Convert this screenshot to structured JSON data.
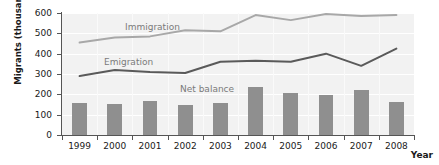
{
  "chart_data": {
    "type": "bar",
    "title": "",
    "xlabel": "Year",
    "ylabel": "Migrants (thousands)",
    "categories": [
      "1999",
      "2000",
      "2001",
      "2002",
      "2003",
      "2004",
      "2005",
      "2006",
      "2007",
      "2008"
    ],
    "ylim": [
      0,
      600
    ],
    "yticks": [
      0,
      100,
      200,
      300,
      400,
      500,
      600
    ],
    "grid": true,
    "legend_position": "inline-annotations",
    "series": [
      {
        "name": "Immigration",
        "type": "line",
        "color": "#a8a8a8",
        "values": [
          455,
          480,
          485,
          515,
          510,
          590,
          565,
          595,
          585,
          590
        ]
      },
      {
        "name": "Emigration",
        "type": "line",
        "color": "#5a5a5a",
        "values": [
          290,
          320,
          310,
          305,
          360,
          365,
          360,
          400,
          340,
          425
        ]
      },
      {
        "name": "Net balance",
        "type": "bar",
        "color": "#8f8f8f",
        "values": [
          158,
          153,
          165,
          150,
          155,
          235,
          205,
          198,
          222,
          163
        ]
      }
    ],
    "annotations": [
      {
        "text": "Immigration",
        "series": "Immigration"
      },
      {
        "text": "Emigration",
        "series": "Emigration"
      },
      {
        "text": "Net balance",
        "series": "Net balance"
      }
    ]
  },
  "axis": {
    "y_title": "Migrants (thousands)",
    "x_title": "Year",
    "y_tick_labels": [
      "600",
      "500",
      "400",
      "300",
      "200",
      "100",
      "0"
    ],
    "x_tick_labels": [
      "1999",
      "2000",
      "2001",
      "2002",
      "2003",
      "2004",
      "2005",
      "2006",
      "2007",
      "2008"
    ]
  },
  "labels": {
    "immigration": "Immigration",
    "emigration": "Emigration",
    "net_balance": "Net balance"
  },
  "colors": {
    "immigration_line": "#a8a8a8",
    "emigration_line": "#5a5a5a",
    "bar_fill": "#8f8f8f",
    "plot_background": "#f2f2f2",
    "axis": "#555555",
    "text": "#1a1a1a"
  }
}
